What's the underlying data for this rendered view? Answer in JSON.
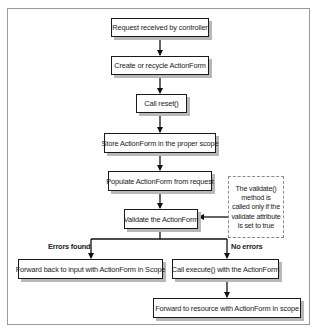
{
  "diagram": {
    "type": "flowchart",
    "nodes": [
      {
        "id": "n1",
        "label": "Request received by controller"
      },
      {
        "id": "n2",
        "label": "Create or recycle ActionForm"
      },
      {
        "id": "n3",
        "label": "Call reset()"
      },
      {
        "id": "n4",
        "label": "Store ActionForm in the proper scope"
      },
      {
        "id": "n5",
        "label": "Populate ActionForm from request"
      },
      {
        "id": "n6",
        "label": "Validate the ActionForm"
      },
      {
        "id": "n7",
        "label": "Forward back to input with ActionForm in Scope"
      },
      {
        "id": "n8",
        "label": "Call execute() with the ActionForm"
      },
      {
        "id": "n9",
        "label": "Forward to resource with ActionForm in scope"
      }
    ],
    "note": {
      "lines": [
        "The validate()",
        "method is",
        "called only if the",
        "validate attribute",
        "is set to true"
      ]
    },
    "branch_labels": {
      "errors": "Errors found",
      "no_errors": "No errors"
    },
    "edges": [
      {
        "from": "n1",
        "to": "n2"
      },
      {
        "from": "n2",
        "to": "n3"
      },
      {
        "from": "n3",
        "to": "n4"
      },
      {
        "from": "n4",
        "to": "n5"
      },
      {
        "from": "n5",
        "to": "n6"
      },
      {
        "from": "note",
        "to": "n6"
      },
      {
        "from": "n6",
        "to": "n7",
        "label": "Errors found"
      },
      {
        "from": "n6",
        "to": "n8",
        "label": "No errors"
      },
      {
        "from": "n8",
        "to": "n9"
      }
    ]
  }
}
